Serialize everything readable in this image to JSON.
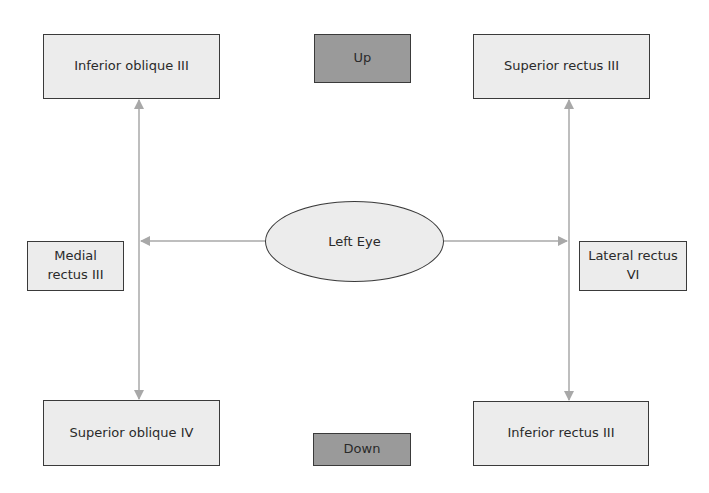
{
  "center": {
    "label": "Left Eye"
  },
  "directions": {
    "up": "Up",
    "down": "Down"
  },
  "muscles": {
    "top_left": "Inferior oblique III",
    "top_right": "Superior rectus III",
    "mid_left": "Medial rectus III",
    "mid_right": "Lateral rectus VI",
    "bottom_left": "Superior oblique IV",
    "bottom_right": "Inferior rectus III"
  },
  "colors": {
    "box_fill": "#ececec",
    "direction_fill": "#9a9a9a",
    "border": "#3a3a3a",
    "arrow": "#a8a8a8"
  }
}
